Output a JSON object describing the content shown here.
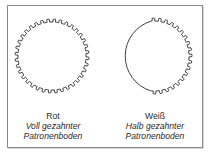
{
  "figures": [
    {
      "color_label": "Rot",
      "description_line1": "Voll gezahnter",
      "description_line2": "Patronenboden",
      "toothing": "full"
    },
    {
      "color_label": "Weiß",
      "description_line1": "Halb gezahnter",
      "description_line2": "Patronenboden",
      "toothing": "half"
    }
  ],
  "colors": {
    "stroke": "#2a2a2a",
    "frame": "#8a8a8a",
    "background": "#ffffff"
  }
}
